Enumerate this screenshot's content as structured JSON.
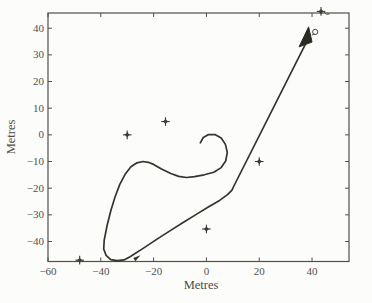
{
  "figure": {
    "width": 372,
    "height": 303,
    "background": "#fcfcfa"
  },
  "labels": {
    "x_axis": "Metres",
    "y_axis": "Metres"
  },
  "colors": {
    "axis": "#50504a",
    "tick_text": "#52524a",
    "trajectory": "#34342e",
    "arrow_fill": "#2b2b26",
    "marker": "#3c3c35"
  },
  "chart_data": {
    "type": "line",
    "title": "",
    "xlabel": "Metres",
    "ylabel": "Metres",
    "xlim": [
      -60,
      54
    ],
    "ylim": [
      -47.5,
      45.7
    ],
    "xticks": [
      -60,
      -40,
      -20,
      0,
      20,
      40
    ],
    "yticks": [
      -40,
      -30,
      -20,
      -10,
      0,
      10,
      20,
      30,
      40
    ],
    "grid": false,
    "legend": false,
    "series": [
      {
        "name": "vehicle-trajectory",
        "description": "Path starts with a small anticlockwise curl near (0,-2), sweeps west over a hump at (-23,-10), descends to a U-turn near (-34,-47), runs straight northeast to a bend at (10,-19), then straight to an arrowhead at (39,40).",
        "points": [
          [
            -2.3,
            -3.0
          ],
          [
            -1.2,
            -1.0
          ],
          [
            0.8,
            0.1
          ],
          [
            3.2,
            0.1
          ],
          [
            5.6,
            -1.2
          ],
          [
            7.2,
            -3.6
          ],
          [
            7.9,
            -6.6
          ],
          [
            7.3,
            -9.8
          ],
          [
            5.6,
            -12.3
          ],
          [
            2.8,
            -14.0
          ],
          [
            -0.8,
            -15.0
          ],
          [
            -4.5,
            -15.7
          ],
          [
            -7.5,
            -16.0
          ],
          [
            -10.5,
            -15.6
          ],
          [
            -13.5,
            -14.5
          ],
          [
            -17.0,
            -12.8
          ],
          [
            -20.0,
            -11.1
          ],
          [
            -22.0,
            -10.3
          ],
          [
            -24.0,
            -10.0
          ],
          [
            -26.3,
            -10.5
          ],
          [
            -28.6,
            -12.0
          ],
          [
            -30.8,
            -14.8
          ],
          [
            -32.8,
            -18.6
          ],
          [
            -34.6,
            -23.2
          ],
          [
            -36.2,
            -28.5
          ],
          [
            -37.6,
            -34.0
          ],
          [
            -38.7,
            -39.5
          ],
          [
            -38.9,
            -42.8
          ],
          [
            -38.0,
            -45.2
          ],
          [
            -36.2,
            -46.8
          ],
          [
            -33.8,
            -47.2
          ],
          [
            -31.2,
            -46.9
          ],
          [
            -28.9,
            -45.7
          ],
          [
            -24.0,
            -42.6
          ],
          [
            -19.0,
            -39.3
          ],
          [
            -14.0,
            -36.1
          ],
          [
            -9.0,
            -33.0
          ],
          [
            -4.0,
            -29.9
          ],
          [
            1.0,
            -26.9
          ],
          [
            5.0,
            -24.6
          ],
          [
            8.0,
            -22.4
          ],
          [
            9.6,
            -20.8
          ],
          [
            10.4,
            -19.2
          ],
          [
            37.6,
            34.2
          ]
        ]
      }
    ],
    "arrow": {
      "tip": [
        38.7,
        40.5
      ],
      "base_left": [
        35.1,
        33.0
      ],
      "base_right": [
        40.0,
        34.8
      ],
      "loop_center": [
        41.2,
        38.6
      ]
    },
    "junction_nub": [
      [
        -27.7,
        -46.2
      ],
      [
        -25.0,
        -45.2
      ],
      [
        -26.9,
        -47.4
      ]
    ],
    "markers": {
      "shape": "four-point-star",
      "points": [
        [
          -48.0,
          -47.0
        ],
        [
          -30.0,
          0.0
        ],
        [
          -15.5,
          5.0
        ],
        [
          0.0,
          -35.3
        ],
        [
          20.0,
          -10.0
        ],
        [
          43.4,
          46.3
        ]
      ]
    }
  }
}
